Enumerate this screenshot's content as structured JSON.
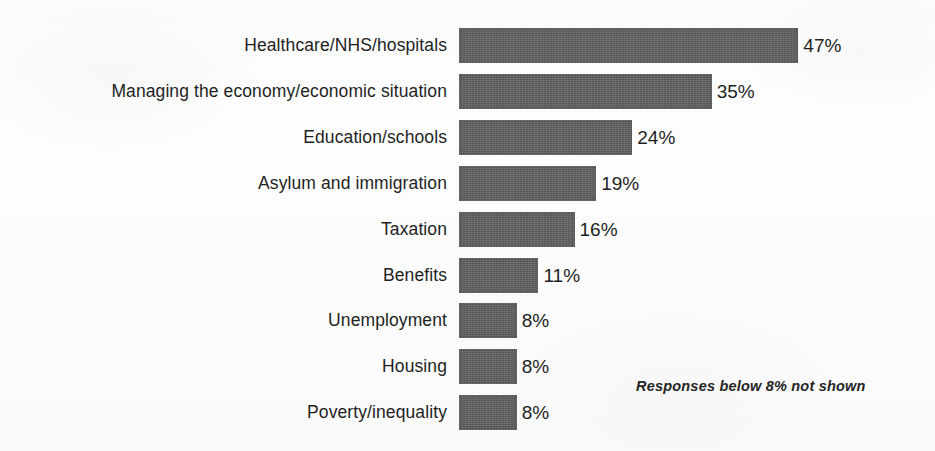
{
  "chart_data": {
    "type": "bar",
    "orientation": "horizontal",
    "title": "",
    "subtitle": "",
    "xlabel": "",
    "ylabel": "",
    "categories": [
      "Healthcare/NHS/hospitals",
      "Managing the economy/economic situation",
      "Education/schools",
      "Asylum and immigration",
      "Taxation",
      "Benefits",
      "Unemployment",
      "Housing",
      "Poverty/inequality"
    ],
    "values": [
      47,
      35,
      24,
      19,
      16,
      11,
      8,
      8,
      8
    ],
    "value_labels": [
      "47%",
      "35%",
      "24%",
      "19%",
      "16%",
      "11%",
      "8%",
      "8%",
      "8%"
    ],
    "value_unit": "%",
    "xlim": [
      0,
      47
    ],
    "grid": false,
    "legend": null,
    "axis_visible": false,
    "tick_labels": [],
    "annotations": [
      {
        "name": "below-threshold-note",
        "text": "Responses below 8% not shown",
        "style": "italic"
      }
    ],
    "colors": {
      "bar": "#636363",
      "text": "#1f1f1f",
      "background": "#fdfdfd"
    }
  },
  "note": {
    "text": "Responses below 8% not shown"
  }
}
